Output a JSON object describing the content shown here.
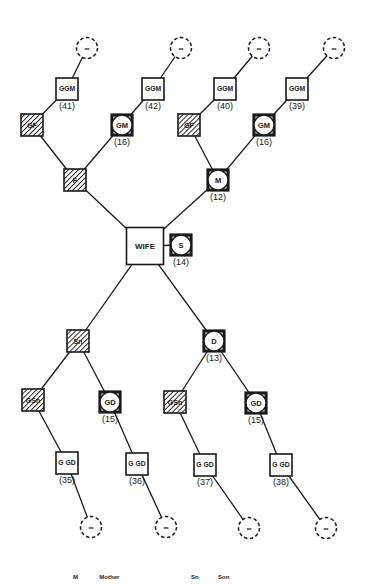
{
  "diagram": {
    "type": "pedigree / kinship chart",
    "colors": {
      "ink": "#1a1a1a",
      "background": "#ffffff"
    },
    "nodes": [
      {
        "id": "inf1",
        "shape": "dashed-circle",
        "label": "∞",
        "x": 87,
        "y": 48
      },
      {
        "id": "inf2",
        "shape": "dashed-circle",
        "label": "∞",
        "x": 181,
        "y": 48
      },
      {
        "id": "inf3",
        "shape": "dashed-circle",
        "label": "∞",
        "x": 259,
        "y": 48
      },
      {
        "id": "inf4",
        "shape": "dashed-circle",
        "label": "∞",
        "x": 334,
        "y": 48
      },
      {
        "id": "ggm41",
        "shape": "square",
        "label": "GGM",
        "age": "(41)",
        "x": 67,
        "y": 89
      },
      {
        "id": "ggm42",
        "shape": "square",
        "label": "GGM",
        "age": "(42)",
        "x": 153,
        "y": 89
      },
      {
        "id": "ggm40",
        "shape": "square",
        "label": "GGM",
        "age": "(40)",
        "x": 225,
        "y": 89
      },
      {
        "id": "ggm39",
        "shape": "square",
        "label": "GGM",
        "age": "(39)",
        "x": 297,
        "y": 89
      },
      {
        "id": "gf1",
        "shape": "hatched-square",
        "label": "GF",
        "x": 32,
        "y": 125
      },
      {
        "id": "gm1",
        "shape": "circle-in-square",
        "label": "GM",
        "age": "(16)",
        "x": 122,
        "y": 125
      },
      {
        "id": "gf2",
        "shape": "hatched-square",
        "label": "GF",
        "x": 189,
        "y": 125
      },
      {
        "id": "gm2",
        "shape": "circle-in-square",
        "label": "GM",
        "age": "(16)",
        "x": 264,
        "y": 125
      },
      {
        "id": "f",
        "shape": "hatched-square",
        "label": "F",
        "x": 75,
        "y": 180
      },
      {
        "id": "m",
        "shape": "circle-in-square",
        "label": "M",
        "age": "(12)",
        "x": 218,
        "y": 180
      },
      {
        "id": "wife",
        "shape": "large-square",
        "label": "WIFE",
        "x": 145,
        "y": 246
      },
      {
        "id": "s",
        "shape": "circle-in-square",
        "label": "S",
        "age": "(14)",
        "x": 181,
        "y": 245
      },
      {
        "id": "sn",
        "shape": "hatched-square",
        "label": "Sn",
        "x": 78,
        "y": 341
      },
      {
        "id": "d",
        "shape": "circle-in-square",
        "label": "D",
        "age": "(13)",
        "x": 214,
        "y": 341
      },
      {
        "id": "gsn1",
        "shape": "hatched-square",
        "label": "GSn",
        "x": 33,
        "y": 400
      },
      {
        "id": "gd1",
        "shape": "circle-in-square",
        "label": "GD",
        "age": "(15)",
        "x": 110,
        "y": 402
      },
      {
        "id": "gsn2",
        "shape": "hatched-square",
        "label": "GSn",
        "x": 175,
        "y": 402
      },
      {
        "id": "gd2",
        "shape": "circle-in-square",
        "label": "GD",
        "age": "(15)",
        "x": 256,
        "y": 403
      },
      {
        "id": "ggd35",
        "shape": "square",
        "label": "G GD",
        "age": "(35)",
        "x": 67,
        "y": 463
      },
      {
        "id": "ggd36",
        "shape": "square",
        "label": "G GD",
        "age": "(36)",
        "x": 137,
        "y": 464
      },
      {
        "id": "ggd37",
        "shape": "square",
        "label": "G GD",
        "age": "(37)",
        "x": 205,
        "y": 465
      },
      {
        "id": "ggd38",
        "shape": "square",
        "label": "G GD",
        "age": "(38)",
        "x": 281,
        "y": 465
      },
      {
        "id": "inf5",
        "shape": "dashed-circle",
        "label": "∞",
        "x": 91,
        "y": 527
      },
      {
        "id": "inf6",
        "shape": "dashed-circle",
        "label": "∞",
        "x": 166,
        "y": 527
      },
      {
        "id": "inf7",
        "shape": "dashed-circle",
        "label": "∞",
        "x": 249,
        "y": 528
      },
      {
        "id": "inf8",
        "shape": "dashed-circle",
        "label": "∞",
        "x": 326,
        "y": 528
      }
    ],
    "edges": [
      [
        "gf1",
        "ggm41"
      ],
      [
        "ggm41",
        "inf1"
      ],
      [
        "gm1",
        "ggm42"
      ],
      [
        "ggm42",
        "inf2"
      ],
      [
        "gf2",
        "ggm40"
      ],
      [
        "ggm40",
        "inf3"
      ],
      [
        "gm2",
        "ggm39"
      ],
      [
        "ggm39",
        "inf4"
      ],
      [
        "f",
        "gf1"
      ],
      [
        "f",
        "gm1"
      ],
      [
        "m",
        "gf2"
      ],
      [
        "m",
        "gm2"
      ],
      [
        "wife",
        "f"
      ],
      [
        "wife",
        "m"
      ],
      [
        "wife",
        "s"
      ],
      [
        "wife",
        "sn"
      ],
      [
        "wife",
        "d"
      ],
      [
        "sn",
        "gsn1"
      ],
      [
        "sn",
        "gd1"
      ],
      [
        "d",
        "gsn2"
      ],
      [
        "d",
        "gd2"
      ],
      [
        "gsn1",
        "ggd35"
      ],
      [
        "gd1",
        "ggd36"
      ],
      [
        "gsn2",
        "ggd37"
      ],
      [
        "gd2",
        "ggd38"
      ],
      [
        "ggd35",
        "inf5"
      ],
      [
        "ggd36",
        "inf6"
      ],
      [
        "ggd37",
        "inf7"
      ],
      [
        "ggd38",
        "inf8"
      ]
    ]
  },
  "legend": {
    "items": [
      {
        "abbr": "M",
        "text": "Mother"
      },
      {
        "abbr": "Sn",
        "text": "Son"
      }
    ]
  }
}
